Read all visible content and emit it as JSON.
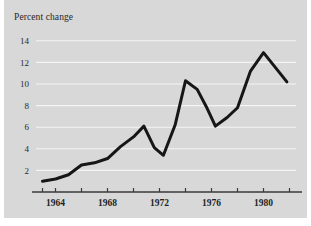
{
  "figure": {
    "background_color": "#d8d8d8",
    "page_background_color": "#ffffff",
    "title": "Percent change"
  },
  "chart_data": {
    "type": "line",
    "title": "Percent change",
    "xlabel": "",
    "ylabel": "",
    "grid": "horizontal",
    "legend": "none",
    "line_color": "#161616",
    "xlim": [
      1962.5,
      1982.5
    ],
    "ylim": [
      0,
      15
    ],
    "yticks": [
      2,
      4,
      6,
      8,
      10,
      12,
      14
    ],
    "ytick_labels": [
      "2",
      "4",
      "6",
      "8",
      "10",
      "12",
      "14"
    ],
    "xticks": [
      1963,
      1964,
      1966,
      1968,
      1970,
      1972,
      1974,
      1976,
      1978,
      1980,
      1982
    ],
    "xtick_labels": [
      "1964",
      "1968",
      "1972",
      "1976",
      "1980"
    ],
    "xtick_label_values": [
      1964,
      1968,
      1972,
      1976,
      1980
    ],
    "x": [
      1963,
      1964,
      1965,
      1966,
      1967,
      1968,
      1969,
      1970,
      1971,
      1972,
      1973,
      1974,
      1975,
      1976,
      1977,
      1978,
      1979,
      1980,
      1981,
      1982
    ],
    "values": [
      1.0,
      1.2,
      1.7,
      2.5,
      2.7,
      3.1,
      4.1,
      5.1,
      6.1,
      4.1,
      3.4,
      6.1,
      10.3,
      9.5,
      7.9,
      6.1,
      6.9,
      7.8,
      11.2,
      12.9
    ],
    "series": [
      {
        "name": "Percent change",
        "points": [
          {
            "x": 1963.0,
            "y": 1.0
          },
          {
            "x": 1964.0,
            "y": 1.2
          },
          {
            "x": 1965.0,
            "y": 1.6
          },
          {
            "x": 1966.0,
            "y": 2.5
          },
          {
            "x": 1967.0,
            "y": 2.7
          },
          {
            "x": 1968.0,
            "y": 3.1
          },
          {
            "x": 1969.0,
            "y": 4.2
          },
          {
            "x": 1970.0,
            "y": 5.1
          },
          {
            "x": 1970.8,
            "y": 6.1
          },
          {
            "x": 1971.6,
            "y": 4.1
          },
          {
            "x": 1972.3,
            "y": 3.4
          },
          {
            "x": 1973.2,
            "y": 6.2
          },
          {
            "x": 1974.0,
            "y": 10.3
          },
          {
            "x": 1974.9,
            "y": 9.5
          },
          {
            "x": 1975.6,
            "y": 7.9
          },
          {
            "x": 1976.3,
            "y": 6.1
          },
          {
            "x": 1977.2,
            "y": 6.9
          },
          {
            "x": 1978.0,
            "y": 7.8
          },
          {
            "x": 1979.0,
            "y": 11.2
          },
          {
            "x": 1980.0,
            "y": 12.9
          },
          {
            "x": 1981.8,
            "y": 10.2
          }
        ]
      }
    ]
  }
}
